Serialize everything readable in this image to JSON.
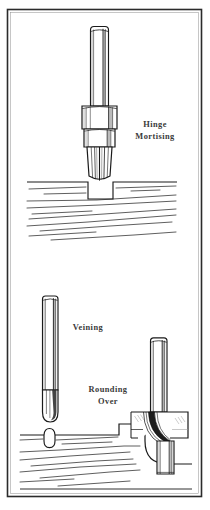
{
  "figure": {
    "border_color": "#2b2b2b",
    "ink_color": "#1a1a1a",
    "label_color": "#3a3a3a",
    "background": "#ffffff",
    "width": 210,
    "height": 510
  },
  "panels": [
    {
      "id": "panel-top",
      "name": "hinge-mortising-panel",
      "label_lines": [
        "Hinge",
        "Mortising"
      ],
      "bit": {
        "name": "hinge-mortising-bit",
        "parts": [
          "shank",
          "upper-collar",
          "lower-collar-ring",
          "tapered-cutter"
        ]
      },
      "workpiece": {
        "name": "wood-board-mortised",
        "feature": "rectangular-mortise-recess",
        "grain_lines": 9
      }
    },
    {
      "id": "panel-bottom",
      "name": "veining-rounding-over-panel",
      "label_lines_veining": [
        "Veining"
      ],
      "label_lines_rounding": [
        "Rounding",
        "Over"
      ],
      "bits": [
        {
          "name": "veining-bit",
          "parts": [
            "shank",
            "round-nose-cutter"
          ]
        },
        {
          "name": "rounding-over-bit",
          "parts": [
            "shank",
            "radius-cutter",
            "pilot-bearing"
          ]
        }
      ],
      "workpiece": {
        "name": "wood-board-profiled",
        "features": [
          "u-groove-vein",
          "rounded-over-edge"
        ],
        "grain_lines": 8
      }
    }
  ],
  "labels": {
    "hinge_line1": "Hinge",
    "hinge_line2": "Mortising",
    "veining": "Veining",
    "rounding_line1": "Rounding",
    "rounding_line2": "Over"
  }
}
